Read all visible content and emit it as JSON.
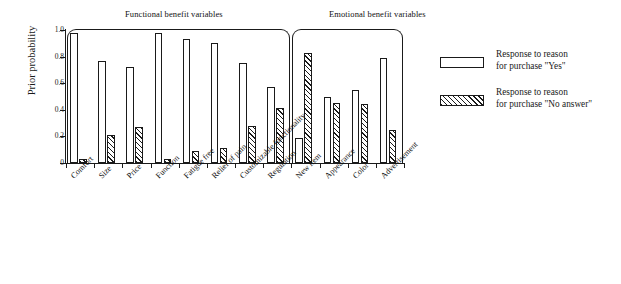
{
  "chart_data": {
    "type": "bar",
    "title": "",
    "xlabel": "",
    "ylabel": "Prior probability",
    "ylim": [
      0,
      1.0
    ],
    "ytick_labels": [
      "0",
      "0.2",
      "0.4",
      "0.6",
      "0.8",
      "1.0"
    ],
    "ytick_values": [
      0,
      0.2,
      0.4,
      0.6,
      0.8,
      1.0
    ],
    "grid": false,
    "legend_position": "right",
    "categories": [
      "Comfort",
      "Size",
      "Price",
      "Function",
      "Fatigue free",
      "Relief of pain",
      "Customizable functionality",
      "Regulation",
      "New item",
      "Appearance",
      "Color",
      "Advertisement"
    ],
    "series": [
      {
        "name": "Response to reason for purchase \"Yes\"",
        "style": "open",
        "values": [
          0.98,
          0.77,
          0.72,
          0.98,
          0.93,
          0.9,
          0.75,
          0.57,
          0.19,
          0.5,
          0.55,
          0.79
        ]
      },
      {
        "name": "Response to reason for purchase \"No answer\"",
        "style": "hatched",
        "values": [
          0.03,
          0.21,
          0.27,
          0.03,
          0.09,
          0.11,
          0.28,
          0.41,
          0.83,
          0.45,
          0.44,
          0.25
        ]
      }
    ],
    "annotations": [
      {
        "name": "group-bracket",
        "label": "Functional benefit variables",
        "categories": [
          "Comfort",
          "Size",
          "Price",
          "Function",
          "Fatigue free",
          "Relief of pain",
          "Customizable functionality",
          "Regulation"
        ]
      },
      {
        "name": "group-bracket",
        "label": "Emotional benefit variables",
        "categories": [
          "New item",
          "Appearance",
          "Color",
          "Advertisement"
        ]
      }
    ]
  },
  "groups": {
    "functional": {
      "title": "Functional benefit variables"
    },
    "emotional": {
      "title": "Emotional benefit variables"
    }
  },
  "legend": {
    "items": [
      {
        "swatch": "open-rectangle-swatch",
        "label": "Response to reason\nfor purchase \"Yes\""
      },
      {
        "swatch": "hatched-rectangle-swatch",
        "label": "Response to reason\nfor purchase \"No answer\""
      }
    ]
  }
}
